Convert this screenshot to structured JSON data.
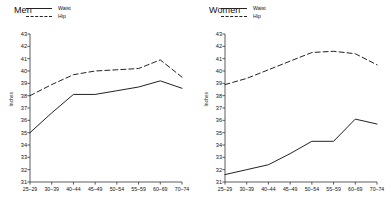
{
  "chart_data": [
    {
      "type": "line",
      "title": "Men",
      "xlabel": "",
      "ylabel": "Inches",
      "categories": [
        "25–29",
        "30–39",
        "40–44",
        "45–49",
        "50–54",
        "55–59",
        "60–69",
        "70–74"
      ],
      "ylim": [
        31,
        43
      ],
      "yticks": [
        31,
        32,
        33,
        34,
        35,
        36,
        37,
        38,
        39,
        40,
        41,
        42,
        43
      ],
      "grid": false,
      "legend_position": "top-left",
      "series": [
        {
          "name": "Waist",
          "style": "solid",
          "color": "#222222",
          "values": [
            35.0,
            36.6,
            38.1,
            38.1,
            38.4,
            38.7,
            39.2,
            38.6
          ]
        },
        {
          "name": "Hip",
          "style": "dashed",
          "color": "#222222",
          "values": [
            38.0,
            38.9,
            39.7,
            40.0,
            40.1,
            40.2,
            40.9,
            39.5
          ]
        }
      ]
    },
    {
      "type": "line",
      "title": "Women",
      "xlabel": "",
      "ylabel": "Inches",
      "categories": [
        "25–29",
        "30–39",
        "40–44",
        "45–49",
        "50–54",
        "55–59",
        "60–69",
        "70–74"
      ],
      "ylim": [
        31,
        43
      ],
      "yticks": [
        31,
        32,
        33,
        34,
        35,
        36,
        37,
        38,
        39,
        40,
        41,
        42,
        43
      ],
      "grid": false,
      "legend_position": "top-left",
      "series": [
        {
          "name": "Waist",
          "style": "solid",
          "color": "#222222",
          "values": [
            31.6,
            32.0,
            32.4,
            33.3,
            34.3,
            34.3,
            36.1,
            35.7
          ]
        },
        {
          "name": "Hip",
          "style": "dashed",
          "color": "#222222",
          "values": [
            38.9,
            39.4,
            40.1,
            40.8,
            41.5,
            41.6,
            41.4,
            40.5
          ]
        }
      ]
    }
  ]
}
